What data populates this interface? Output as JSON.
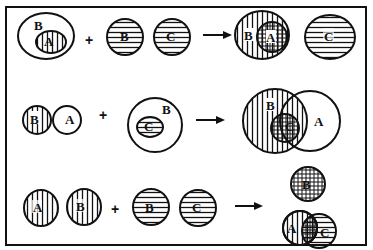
{
  "diagram": {
    "type": "venn-set-operations",
    "colors": {
      "stroke": "#111111",
      "background": "#ffffff"
    },
    "operators": {
      "plus": "+",
      "arrow": "→"
    },
    "rows": [
      {
        "id": "row1",
        "operand1": {
          "description": "A inside B",
          "outer": "B",
          "inner": "A",
          "inner_fill": "vertical"
        },
        "operand2": [
          {
            "label": "B",
            "fill": "horizontal"
          },
          {
            "label": "C",
            "fill": "horizontal"
          }
        ],
        "result": {
          "description": "B with A inside, plus separate C",
          "sets": [
            {
              "label": "B",
              "fill": "vertical"
            },
            {
              "label": "A",
              "fill": "crosshatch"
            },
            {
              "label": "C",
              "fill": "horizontal"
            }
          ]
        }
      },
      {
        "id": "row2",
        "operand1": {
          "description": "B overlapping A",
          "sets": [
            {
              "label": "B",
              "fill": "vertical"
            },
            {
              "label": "A",
              "fill": "none"
            }
          ]
        },
        "operand2": {
          "description": "C inside B",
          "outer": "B",
          "inner": "C",
          "inner_fill": "horizontal"
        },
        "result": {
          "description": "B overlapping A, C inside intersection",
          "sets": [
            {
              "label": "B",
              "fill": "vertical"
            },
            {
              "label": "A",
              "fill": "none"
            },
            {
              "label": "C",
              "fill": "crosshatch"
            }
          ]
        }
      },
      {
        "id": "row3",
        "operand1": [
          {
            "label": "A",
            "fill": "vertical"
          },
          {
            "label": "B",
            "fill": "vertical"
          }
        ],
        "operand2": [
          {
            "label": "B",
            "fill": "horizontal"
          },
          {
            "label": "C",
            "fill": "horizontal"
          }
        ],
        "result": {
          "description": "B separate crosshatched; A overlapping C",
          "sets": [
            {
              "label": "B",
              "fill": "crosshatch"
            },
            {
              "label": "A",
              "fill": "vertical"
            },
            {
              "label": "C",
              "fill": "horizontal"
            }
          ]
        }
      }
    ],
    "labels": {
      "r1_b_outer": "B",
      "r1_a_inner": "A",
      "r1_b2": "B",
      "r1_c2": "C",
      "r1_res_b": "B",
      "r1_res_a": "A",
      "r1_res_c": "C",
      "r2_b": "B",
      "r2_a": "A",
      "r2_b_outer": "B",
      "r2_c_inner": "C",
      "r2_res_b": "B",
      "r2_res_a": "A",
      "r2_res_c": "C",
      "r3_a": "A",
      "r3_b": "B",
      "r3_b2": "B",
      "r3_c2": "C",
      "r3_res_b": "B",
      "r3_res_a": "A",
      "r3_res_c": "C"
    }
  }
}
